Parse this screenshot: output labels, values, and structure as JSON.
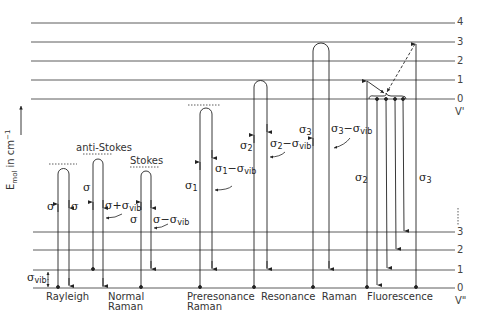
{
  "axis": {
    "y_label_main": "E",
    "y_label_sub": "mol",
    "y_label_unit": " in cm",
    "y_label_sup": "−1"
  },
  "upper_levels": {
    "name": "V'",
    "labels": [
      "4",
      "3",
      "2",
      "1",
      "0"
    ]
  },
  "lower_levels": {
    "name": "V\"",
    "labels": [
      "3",
      "2",
      "1",
      "0"
    ],
    "ellipsis": "⋮"
  },
  "processes": [
    {
      "id": "rayleigh",
      "label_line1": "Rayleigh",
      "label_line2": ""
    },
    {
      "id": "normal-raman",
      "label_line1": "Normal",
      "label_line2": "Raman"
    },
    {
      "id": "preresonance-raman",
      "label_line1": "Preresonance",
      "label_line2": "Raman"
    },
    {
      "id": "resonance-raman",
      "label_line1": "Resonance  Raman",
      "label_line2": ""
    },
    {
      "id": "fluorescence",
      "label_line1": "Fluorescence",
      "label_line2": ""
    }
  ],
  "annotations": {
    "anti_stokes": "anti-Stokes",
    "stokes": "Stokes",
    "sigma": "σ",
    "sigma_vib": "σ",
    "vib_sub": "vib",
    "sigma_plus_vib": "σ+σ",
    "sigma_minus_vib": "σ−σ",
    "sigma1": "σ",
    "sub1": "1",
    "sigma1_minus_vib": "σ",
    "sigma2": "σ",
    "sub2": "2",
    "sigma3": "σ",
    "sub3": "3",
    "minus_sigma": "−σ"
  }
}
